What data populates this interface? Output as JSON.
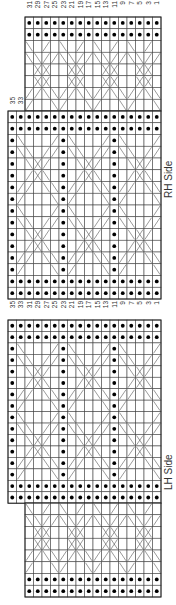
{
  "chart_data": {
    "type": "knitting-chart",
    "orientation": "rotated-90",
    "row_labels_top": [
      "31",
      "29",
      "27",
      "25",
      "23",
      "21",
      "19",
      "17",
      "15",
      "13",
      "11",
      "9",
      "7",
      "5",
      "3",
      "1"
    ],
    "row_labels_mid": [
      "35",
      "33",
      "31",
      "29",
      "27",
      "25",
      "23",
      "21",
      "19",
      "17",
      "15",
      "13",
      "11",
      "9",
      "7",
      "5",
      "3",
      "1"
    ],
    "row_labels_rh_extra": [
      "35",
      "33"
    ],
    "sections": [
      {
        "name": "RH Side",
        "narrow_columns": 16,
        "wide_columns": 18
      },
      {
        "name": "LH Side",
        "narrow_columns": 16,
        "wide_columns": 18
      }
    ],
    "wide_pattern_rows": [
      [
        "\\",
        "",
        "",
        "",
        "/"
      ],
      [
        "\\",
        "\\",
        "",
        "/",
        "/"
      ],
      [
        "",
        "\\",
        "x",
        "/",
        ""
      ],
      [
        "",
        "/",
        "x",
        "\\",
        ""
      ],
      [
        "/",
        "/",
        "",
        "\\",
        "\\"
      ],
      [
        "/",
        "",
        "",
        "",
        "\\"
      ]
    ],
    "narrow_pattern_rows": [
      [
        "\\",
        "",
        "/",
        ""
      ],
      [
        "\\",
        "\\",
        "/",
        "/"
      ],
      [
        "",
        "x",
        "x",
        ""
      ],
      [
        "",
        "x",
        "x",
        ""
      ],
      [
        "/",
        "/",
        "\\",
        "\\"
      ],
      [
        "/",
        "",
        "",
        "\\"
      ]
    ],
    "legend": {
      "dot": "purl",
      "slash": "cross"
    }
  },
  "labels": {
    "rh_side": "RH Side",
    "lh_side": "LH Side"
  },
  "colors": {
    "grid": "#444444",
    "dot": "#000000",
    "line": "#555555"
  }
}
